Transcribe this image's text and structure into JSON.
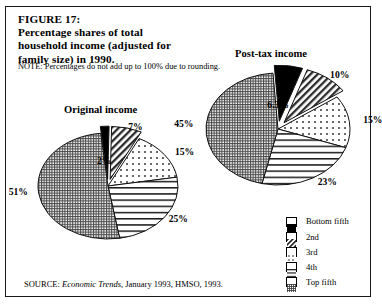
{
  "figure": {
    "note": "NOTE: Percentages do not add up to 100% due to rounding.",
    "source_prefix": "SOURCE: ",
    "source_italic": "Economic Trends",
    "source_suffix": ", January 1993, HMSO, 1993."
  },
  "legend": {
    "items": [
      {
        "label": "Bottom fifth",
        "pattern": "solid-black"
      },
      {
        "label": "2nd",
        "pattern": "diagonal-hatch"
      },
      {
        "label": "3rd",
        "pattern": "dots"
      },
      {
        "label": "4th",
        "pattern": "horizontal-lines"
      },
      {
        "label": "Top fifth",
        "pattern": "fine-grid"
      }
    ]
  },
  "chart_data": [
    {
      "type": "pie",
      "title": "Original income",
      "categories": [
        "Bottom fifth",
        "2nd",
        "3rd",
        "4th",
        "Top fifth"
      ],
      "values": [
        2,
        7,
        15,
        25,
        51
      ],
      "labels": [
        "2%",
        "7%",
        "15%",
        "25%",
        "51%"
      ],
      "exploded": [
        true,
        true,
        false,
        false,
        false
      ],
      "unit": "percent",
      "legend_position": "right"
    },
    {
      "type": "pie",
      "title": "Post-tax income",
      "categories": [
        "Bottom fifth",
        "2nd",
        "3rd",
        "4th",
        "Top fifth"
      ],
      "values": [
        6.3,
        10,
        15,
        23,
        45
      ],
      "labels": [
        "6.3%",
        "10%",
        "15%",
        "23%",
        "45%"
      ],
      "exploded": [
        true,
        true,
        false,
        false,
        false
      ],
      "unit": "percent",
      "legend_position": "right"
    }
  ]
}
